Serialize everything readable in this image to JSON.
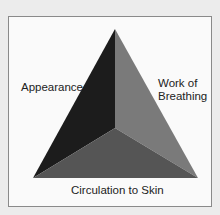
{
  "diagram": {
    "labels": {
      "appearance": "Appearance",
      "work_of_breathing_line1": "Work of",
      "work_of_breathing_line2": "Breathing",
      "circulation": "Circulation to Skin"
    },
    "colors": {
      "background": "#ececec",
      "panel": "#fafafa",
      "left_face": "#1c1c1c",
      "right_face": "#7a7a7a",
      "bottom_face": "#555555"
    }
  }
}
